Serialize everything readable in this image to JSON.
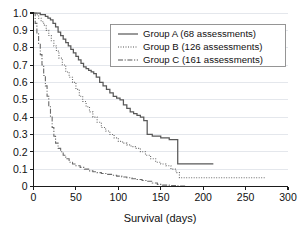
{
  "chart_data": {
    "type": "line",
    "title": "",
    "xlabel": "Survival (days)",
    "ylabel": "",
    "xlim": [
      0,
      300
    ],
    "ylim": [
      0,
      1.0
    ],
    "xticks": [
      0,
      50,
      100,
      150,
      200,
      250,
      300
    ],
    "xtick_labels": [
      "0",
      "50",
      "100",
      "150",
      "200",
      "250",
      "300"
    ],
    "yticks": [
      0,
      0.1,
      0.2,
      0.3,
      0.4,
      0.5,
      0.6,
      0.7,
      0.8,
      0.9,
      1.0
    ],
    "ytick_labels": [
      "0",
      "0.1",
      "0.2",
      "0.3",
      "0.4",
      "0.5",
      "0.6",
      "0.7",
      "0.8",
      "0.9",
      "1.0"
    ],
    "grid": "horizontal",
    "legend_position": "upper-right",
    "series": [
      {
        "name": "Group A (68 assessments)",
        "label": "Group A (68 assessments)",
        "style": "solid",
        "color": "#585858",
        "n": 68,
        "x": [
          0,
          4,
          8,
          11,
          14,
          17,
          20,
          23,
          26,
          29,
          32,
          35,
          38,
          41,
          44,
          47,
          50,
          53,
          56,
          59,
          62,
          65,
          68,
          71,
          74,
          78,
          82,
          86,
          90,
          94,
          98,
          102,
          106,
          110,
          114,
          118,
          122,
          126,
          130,
          134,
          140,
          150,
          160,
          168,
          170,
          190,
          212
        ],
        "y": [
          1.0,
          1.0,
          0.99,
          0.99,
          0.98,
          0.97,
          0.96,
          0.94,
          0.92,
          0.89,
          0.87,
          0.85,
          0.83,
          0.81,
          0.79,
          0.77,
          0.75,
          0.73,
          0.71,
          0.69,
          0.68,
          0.67,
          0.66,
          0.65,
          0.63,
          0.6,
          0.58,
          0.56,
          0.54,
          0.52,
          0.51,
          0.5,
          0.47,
          0.45,
          0.43,
          0.42,
          0.41,
          0.4,
          0.38,
          0.3,
          0.29,
          0.28,
          0.27,
          0.27,
          0.13,
          0.13,
          0.13
        ]
      },
      {
        "name": "Group B (126 assessments)",
        "label": "Group B (126 assessments)",
        "style": "dotted",
        "color": "#6a6a6a",
        "n": 126,
        "x": [
          0,
          3,
          6,
          9,
          12,
          15,
          18,
          21,
          24,
          27,
          30,
          34,
          38,
          42,
          46,
          50,
          54,
          58,
          62,
          66,
          70,
          75,
          80,
          85,
          90,
          95,
          100,
          105,
          110,
          115,
          120,
          126,
          132,
          138,
          144,
          150,
          156,
          162,
          168,
          172,
          180,
          200,
          230,
          273
        ],
        "y": [
          1.0,
          0.99,
          0.97,
          0.95,
          0.93,
          0.9,
          0.87,
          0.84,
          0.81,
          0.78,
          0.74,
          0.7,
          0.66,
          0.63,
          0.6,
          0.56,
          0.52,
          0.49,
          0.46,
          0.43,
          0.4,
          0.37,
          0.34,
          0.32,
          0.3,
          0.28,
          0.26,
          0.25,
          0.24,
          0.23,
          0.22,
          0.2,
          0.18,
          0.16,
          0.14,
          0.13,
          0.12,
          0.1,
          0.08,
          0.05,
          0.05,
          0.05,
          0.05,
          0.05
        ]
      },
      {
        "name": "Group C (161 assessments)",
        "label": "Group C (161 assessments)",
        "style": "dash-dot",
        "color": "#6a6a6a",
        "n": 161,
        "x": [
          0,
          2,
          4,
          6,
          8,
          10,
          12,
          14,
          16,
          18,
          20,
          22,
          24,
          26,
          29,
          32,
          35,
          38,
          42,
          46,
          50,
          55,
          60,
          65,
          70,
          75,
          80,
          86,
          92,
          98,
          104,
          110,
          116,
          122,
          128,
          134,
          140,
          146,
          152,
          160,
          170,
          180
        ],
        "y": [
          1.0,
          0.94,
          0.88,
          0.82,
          0.76,
          0.7,
          0.64,
          0.58,
          0.52,
          0.46,
          0.4,
          0.34,
          0.29,
          0.25,
          0.22,
          0.2,
          0.18,
          0.16,
          0.14,
          0.13,
          0.12,
          0.11,
          0.1,
          0.09,
          0.085,
          0.08,
          0.075,
          0.07,
          0.065,
          0.06,
          0.055,
          0.05,
          0.045,
          0.04,
          0.035,
          0.03,
          0.02,
          0.012,
          0.008,
          0.005,
          0.003,
          0.0
        ]
      }
    ]
  }
}
